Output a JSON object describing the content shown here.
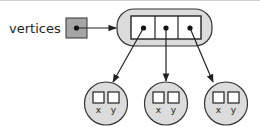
{
  "diagram": {
    "variable_label": "vertices",
    "array_cells": 3,
    "points": [
      {
        "fields": [
          "x",
          "y"
        ]
      },
      {
        "fields": [
          "x",
          "y"
        ]
      },
      {
        "fields": [
          "x",
          "y"
        ]
      }
    ],
    "colors": {
      "fill_gray": "#d9d9d9",
      "var_box": "#a6a6a6",
      "stroke": "#222222",
      "top_rule": "#bdbdbd"
    }
  }
}
